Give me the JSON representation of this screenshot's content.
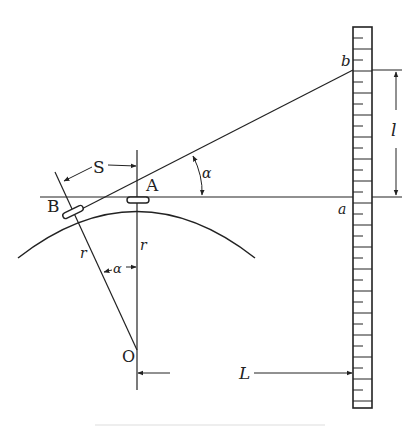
{
  "diagram": {
    "type": "geometric-optics",
    "labels": {
      "point_A": "A",
      "point_B": "B",
      "point_O": "O",
      "point_a": "a",
      "point_b": "b",
      "arc_length": "S",
      "angle": "α",
      "angle_center": "α",
      "radius_left": "r",
      "radius_right": "r",
      "distance": "L",
      "scale_length": "l"
    },
    "colors": {
      "line": "#222222",
      "background": "#ffffff"
    }
  }
}
